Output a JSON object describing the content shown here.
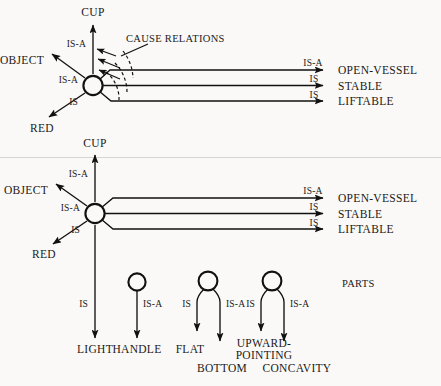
{
  "figure": {
    "background_color": "#faf9f7",
    "ink_color": "#111111",
    "divider_color": "#d8d5d0",
    "annotation": "CAUSE RELATIONS",
    "parts_label": "PARTS"
  },
  "relations": {
    "is_a": "IS-A",
    "is": "IS"
  },
  "top_panel": {
    "center_node": "cup-node-top",
    "up_label": "CUP",
    "up_relation": "IS-A",
    "upleft_label": "OBJECT",
    "upleft_relation": "IS-A",
    "downleft_label": "RED",
    "downleft_relation": "IS",
    "right_edges": [
      {
        "relation": "IS-A",
        "target": "OPEN-VESSEL"
      },
      {
        "relation": "IS",
        "target": "STABLE"
      },
      {
        "relation": "IS",
        "target": "LIFTABLE"
      }
    ],
    "cause_annotation": "CAUSE RELATIONS"
  },
  "bottom_panel": {
    "center_node": "cup-node-bottom",
    "up_label": "CUP",
    "up_relation": "IS-A",
    "upleft_label": "OBJECT",
    "upleft_relation": "IS-A",
    "downleft_label": "RED",
    "downleft_relation": "IS",
    "right_edges": [
      {
        "relation": "IS-A",
        "target": "OPEN-VESSEL"
      },
      {
        "relation": "IS",
        "target": "STABLE"
      },
      {
        "relation": "IS",
        "target": "LIFTABLE"
      }
    ],
    "down_relation": "IS",
    "down_label": "LIGHT",
    "parts_label": "PARTS",
    "parts": [
      {
        "node": "part-node-handle",
        "edges": [
          {
            "relation": "IS-A",
            "target": "HANDLE"
          }
        ]
      },
      {
        "node": "part-node-bottom",
        "edges": [
          {
            "relation": "IS",
            "target": "FLAT"
          },
          {
            "relation": "IS-A",
            "target": "BOTTOM"
          }
        ]
      },
      {
        "node": "part-node-concavity",
        "edges": [
          {
            "relation": "IS",
            "target": "UPWARD-POINTING"
          },
          {
            "relation": "IS-A",
            "target": "CONCAVITY"
          }
        ]
      }
    ],
    "upward_pointing_line1": "UPWARD-",
    "upward_pointing_line2": "POINTING"
  }
}
